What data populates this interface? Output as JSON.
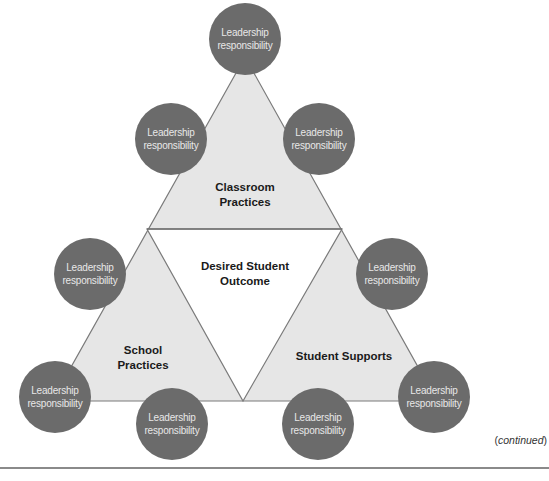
{
  "diagram": {
    "colors": {
      "circle_fill": "#6b6b6b",
      "circle_text": "#e8e8e8",
      "triangle_fill": "#e6e6e6",
      "center_fill": "#ffffff",
      "stroke": "#7a7a7a",
      "label_text": "#1a1a1a"
    },
    "center": {
      "line1": "Desired Student",
      "line2": "Outcome"
    },
    "sections": {
      "top": {
        "line1": "Classroom",
        "line2": "Practices"
      },
      "left": {
        "line1": "School",
        "line2": "Practices"
      },
      "right": {
        "line1": "Student Supports"
      }
    },
    "nodes": [
      {
        "position": "top",
        "line1": "Leadership",
        "line2": "responsibility"
      },
      {
        "position": "top-left",
        "line1": "Leadership",
        "line2": "responsibility"
      },
      {
        "position": "top-right",
        "line1": "Leadership",
        "line2": "responsibility"
      },
      {
        "position": "middle-left",
        "line1": "Leadership",
        "line2": "responsibility"
      },
      {
        "position": "middle-right",
        "line1": "Leadership",
        "line2": "responsibility"
      },
      {
        "position": "bottom-left-outer",
        "line1": "Leadership",
        "line2": "responsibility"
      },
      {
        "position": "bottom-left-inner",
        "line1": "Leadership",
        "line2": "responsibility"
      },
      {
        "position": "bottom-right-inner",
        "line1": "Leadership",
        "line2": "responsibility"
      },
      {
        "position": "bottom-right-outer",
        "line1": "Leadership",
        "line2": "responsibility"
      }
    ]
  },
  "footer": {
    "continued_open": "(",
    "continued_word": "continued",
    "continued_close": ")"
  }
}
